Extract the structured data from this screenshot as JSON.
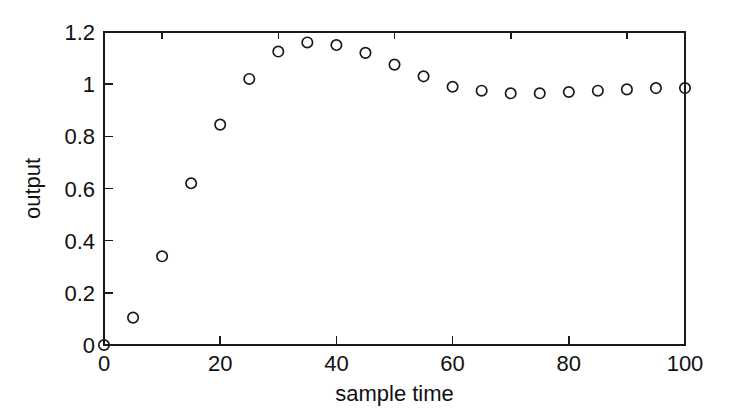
{
  "chart_data": {
    "type": "scatter",
    "title": "",
    "subtitle": "",
    "xlabel": "sample  time",
    "ylabel": "output",
    "xlim": [
      0,
      100
    ],
    "ylim": [
      0,
      1.2
    ],
    "xticks": [
      0,
      20,
      40,
      60,
      80,
      100
    ],
    "xticklabels": [
      "0",
      "20",
      "40",
      "60",
      "80",
      "100"
    ],
    "xminorticks": [
      10,
      30,
      50,
      70,
      90
    ],
    "yticks": [
      0,
      0.2,
      0.4,
      0.6,
      0.8,
      1.0,
      1.2
    ],
    "yticklabels": [
      "0",
      "0.2",
      "0.4",
      "0.6",
      "0.8",
      "1",
      "1.2"
    ],
    "grid": false,
    "legend": null,
    "legend_position": "none",
    "marker": "circle-open",
    "marker_color": "#1a1a1a",
    "series": [
      {
        "name": "output",
        "x": [
          0,
          5,
          10,
          15,
          20,
          25,
          30,
          35,
          40,
          45,
          50,
          55,
          60,
          65,
          70,
          75,
          80,
          85,
          90,
          95,
          100
        ],
        "y": [
          0.0,
          0.105,
          0.34,
          0.62,
          0.845,
          1.02,
          1.125,
          1.16,
          1.15,
          1.12,
          1.075,
          1.03,
          0.99,
          0.975,
          0.965,
          0.965,
          0.97,
          0.975,
          0.98,
          0.985,
          0.985
        ]
      }
    ],
    "annotations": []
  },
  "figure": {
    "background_color": "#ffffff",
    "axis_color": "#1a1a1a",
    "text_color": "#111111"
  }
}
